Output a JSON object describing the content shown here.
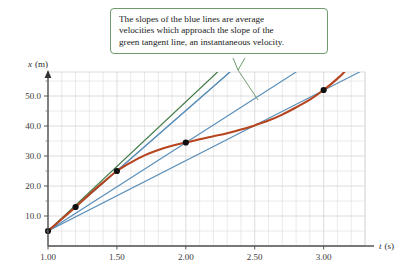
{
  "callout": {
    "lines": [
      "The slopes of the blue lines are average",
      "velocities which approach the slope of the",
      "green tangent line, an instantaneous velocity."
    ],
    "border_color": "#6f9b6f"
  },
  "colors": {
    "curve_red": "#b5441f",
    "tangent_green": "#3f7a46",
    "secant_blue": "#5b8fb9",
    "grid": "#d8d8d8",
    "axis": "#555555",
    "marker": "#111111",
    "callout_border": "#6f9b6f",
    "text": "#2b2b2b"
  },
  "axes": {
    "x_title_symbol": "t",
    "x_title_unit": "(s)",
    "y_title_symbol": "x",
    "y_title_unit": "(m)",
    "x_ticks": [
      "1.00",
      "1.50",
      "2.00",
      "2.50",
      "3.00"
    ],
    "y_ticks": [
      "10.0",
      "20.0",
      "30.0",
      "40.0",
      "50.0"
    ]
  },
  "chart_data": {
    "type": "line",
    "title": "",
    "xlabel": "t (s)",
    "ylabel": "x (m)",
    "xlim": [
      1.0,
      3.3
    ],
    "ylim": [
      0.0,
      58.0
    ],
    "grid": true,
    "legend": "none",
    "annotations": [
      {
        "text": "The slopes of the blue lines are average velocities which approach the slope of the green tangent line, an instantaneous velocity.",
        "points_to_x": 2.55,
        "points_to_y": 45.0
      }
    ],
    "series": [
      {
        "name": "position curve",
        "type": "line",
        "color": "#b5441f",
        "x": [
          1.0,
          1.1,
          1.2,
          1.3,
          1.4,
          1.5,
          1.6,
          1.7,
          1.8,
          1.9,
          2.0,
          2.1,
          2.2,
          2.3,
          2.4,
          2.5,
          2.6,
          2.7,
          2.8,
          2.9,
          3.0,
          3.1,
          3.15
        ],
        "y": [
          5.0,
          9.0,
          13.0,
          17.2,
          21.2,
          25.0,
          27.8,
          30.2,
          32.0,
          33.4,
          34.5,
          35.6,
          36.6,
          37.6,
          38.8,
          40.2,
          41.8,
          43.8,
          46.2,
          48.8,
          52.0,
          55.8,
          58.0
        ]
      },
      {
        "name": "tangent line at t=1.00",
        "type": "line",
        "color": "#3f7a46",
        "x": [
          1.0,
          2.23
        ],
        "y": [
          5.0,
          58.0
        ],
        "slope": 43.0
      },
      {
        "name": "secant to t=1.20",
        "type": "line",
        "color": "#5b8fb9",
        "x": [
          1.0,
          2.32
        ],
        "y": [
          5.0,
          58.0
        ],
        "slope": 40.0
      },
      {
        "name": "secant to t=1.50",
        "type": "line",
        "color": "#5b8fb9",
        "x": [
          1.0,
          2.32
        ],
        "y": [
          5.0,
          58.0
        ],
        "slope": 40.0
      },
      {
        "name": "secant to t=2.00",
        "type": "line",
        "color": "#5b8fb9",
        "x": [
          1.0,
          2.8
        ],
        "y": [
          5.0,
          58.0
        ],
        "slope": 29.5
      },
      {
        "name": "secant to t=3.00",
        "type": "line",
        "color": "#5b8fb9",
        "x": [
          1.0,
          3.26
        ],
        "y": [
          5.0,
          58.0
        ],
        "slope": 23.5
      }
    ],
    "markers": [
      {
        "label": "start",
        "x": 1.0,
        "y": 5.0
      },
      {
        "label": "point at t=1.20",
        "x": 1.2,
        "y": 13.0
      },
      {
        "label": "point at t=1.50",
        "x": 1.5,
        "y": 25.0
      },
      {
        "label": "point at t=2.00",
        "x": 2.0,
        "y": 34.5
      },
      {
        "label": "point at t=3.00",
        "x": 3.0,
        "y": 52.0
      }
    ]
  }
}
